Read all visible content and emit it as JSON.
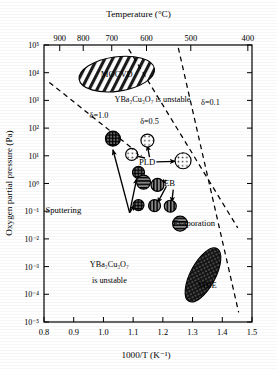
{
  "chart_data": {
    "type": "scatter",
    "title": "",
    "xlabel": "1000/T (K⁻¹)",
    "ylabel": "Oxygen partial pressure (Pa)",
    "top_axis_label": "Temperature  (°C)",
    "xlim": [
      0.8,
      1.5
    ],
    "ylim_exp": [
      -5,
      5
    ],
    "yscale": "log",
    "grid": false,
    "legend_position": "none",
    "x_ticks": [
      "0.8",
      "0.9",
      "1.0",
      "1.1",
      "1.2",
      "1.3",
      "1.4",
      "1.5"
    ],
    "x_tick_values": [
      0.8,
      0.9,
      1.0,
      1.1,
      1.2,
      1.3,
      1.4,
      1.5
    ],
    "y_ticks": [
      "10⁵",
      "10⁴",
      "10³",
      "10²",
      "10¹",
      "10⁰",
      "10⁻¹",
      "10⁻²",
      "10⁻³",
      "10⁻⁴",
      "10⁻⁵"
    ],
    "y_tick_exponents": [
      5,
      4,
      3,
      2,
      1,
      0,
      -1,
      -2,
      -3,
      -4,
      -5
    ],
    "top_ticks": [
      "900",
      "800",
      "700",
      "600",
      "500",
      "400"
    ],
    "top_tick_celsius": [
      900,
      800,
      700,
      600,
      500,
      400
    ],
    "top_tick_x": [
      0.853,
      0.932,
      1.028,
      1.145,
      1.294,
      1.486
    ],
    "annotations": [
      {
        "name": "delta-1-0",
        "text": "δ=1.0",
        "x": 0.985,
        "y_exp": 2.35
      },
      {
        "name": "delta-0-5",
        "text": "δ=0.5",
        "x": 1.155,
        "y_exp": 2.15
      },
      {
        "name": "delta-0-1",
        "text": "δ=0.1",
        "x": 1.36,
        "y_exp": 2.85
      },
      {
        "name": "ybco-unstable-upper",
        "text": "YBa₂Cu₃O₇ is unstable",
        "x": 1.165,
        "y_exp": 2.95
      },
      {
        "name": "ybco-unstable-lower-line1",
        "text": "YBa₂Cu₃O₇",
        "x": 1.02,
        "y_exp": -3.0
      },
      {
        "name": "ybco-unstable-lower-line2",
        "text": "is unstable",
        "x": 1.02,
        "y_exp": -3.6
      }
    ],
    "regions": [
      {
        "name": "mocvd",
        "label": "MOCVD",
        "x": 1.045,
        "y_exp": 3.95,
        "rx_x": 0.128,
        "ry_exp": 0.62,
        "rotation": -8,
        "hatch": "diagonal-forward"
      },
      {
        "name": "mbe",
        "label": "MBE",
        "x": 1.335,
        "y_exp": -3.3,
        "rx_x": 0.042,
        "ry_exp": 1.08,
        "rotation": 28,
        "hatch": "crosshatch-dense"
      }
    ],
    "method_labels": [
      {
        "name": "sputtering",
        "text": "Sputtering",
        "x": 0.865,
        "y_exp": -0.95
      },
      {
        "name": "pld",
        "text": "PLD",
        "x": 1.147,
        "y_exp": 0.78
      },
      {
        "name": "eb",
        "text": "EB",
        "x": 1.222,
        "y_exp": 0.02
      },
      {
        "name": "evaporation",
        "text": "Evaporation",
        "x": 1.305,
        "y_exp": -1.42
      },
      {
        "name": "mocvd",
        "text": "MOCVD",
        "x": 1.045,
        "y_exp": 3.95
      },
      {
        "name": "mbe",
        "text": "MBE",
        "x": 1.35,
        "y_exp": -3.65
      }
    ],
    "markers": [
      {
        "name": "marker-sputtering-a",
        "x": 1.032,
        "y_exp": 1.62,
        "fill": "grid",
        "r": 7.5
      },
      {
        "name": "marker-sputtering-b",
        "x": 1.095,
        "y_exp": 1.05,
        "fill": "dots",
        "r": 6.0
      },
      {
        "name": "marker-sputtering-c",
        "x": 1.118,
        "y_exp": 0.4,
        "fill": "grid",
        "r": 6.0
      },
      {
        "name": "marker-sputtering-d",
        "x": 1.135,
        "y_exp": 0.05,
        "fill": "horizontal",
        "r": 7.0
      },
      {
        "name": "marker-sputtering-e",
        "x": 1.182,
        "y_exp": -0.05,
        "fill": "vertical",
        "r": 6.5
      },
      {
        "name": "marker-sputtering-f",
        "x": 1.118,
        "y_exp": -0.78,
        "fill": "grid",
        "r": 5.5
      },
      {
        "name": "marker-sputtering-g",
        "x": 1.172,
        "y_exp": -0.8,
        "fill": "vertical",
        "r": 6.0
      },
      {
        "name": "marker-sputtering-h",
        "x": 1.225,
        "y_exp": -0.82,
        "fill": "vertical",
        "r": 6.0
      },
      {
        "name": "marker-pld-a",
        "x": 1.148,
        "y_exp": 1.55,
        "fill": "dots",
        "r": 6.5
      },
      {
        "name": "marker-pld-b",
        "x": 1.268,
        "y_exp": 0.82,
        "fill": "dots",
        "r": 8.0
      },
      {
        "name": "marker-evaporation",
        "x": 1.258,
        "y_exp": -1.45,
        "fill": "horizontal",
        "r": 7.5
      }
    ],
    "arrows": [
      {
        "name": "arrow-sputtering-trunk",
        "x1": 1.088,
        "y1_exp": -1.05,
        "x2": 1.032,
        "y2_exp": 1.22
      },
      {
        "name": "arrow-sputtering-to-c",
        "x1": 1.088,
        "y1_exp": -1.05,
        "x2": 1.112,
        "y2_exp": 0.18
      },
      {
        "name": "arrow-sputtering-to-f",
        "x1": 1.088,
        "y1_exp": -1.05,
        "x2": 1.105,
        "y2_exp": -0.78
      },
      {
        "name": "arrow-pld-to-b",
        "x1": 1.178,
        "y1_exp": 0.78,
        "x2": 1.242,
        "y2_exp": 0.8
      },
      {
        "name": "arrow-pld-to-a",
        "x1": 1.155,
        "y1_exp": 0.95,
        "x2": 1.148,
        "y2_exp": 1.38
      },
      {
        "name": "arrow-pld-to-sput-b",
        "x1": 1.14,
        "y1_exp": 0.92,
        "x2": 1.1,
        "y2_exp": 1.02
      },
      {
        "name": "arrow-eb-to-e",
        "x1": 1.212,
        "y1_exp": 0.12,
        "x2": 1.192,
        "y2_exp": 0.0
      },
      {
        "name": "arrow-eb-to-g",
        "x1": 1.212,
        "y1_exp": -0.1,
        "x2": 1.182,
        "y2_exp": -0.7
      },
      {
        "name": "arrow-eb-to-h",
        "x1": 1.235,
        "y1_exp": -0.22,
        "x2": 1.23,
        "y2_exp": -0.68
      }
    ],
    "boundary_lines": [
      {
        "name": "delta-1-0-line",
        "x1": 0.818,
        "y1_exp": 3.65,
        "x2": 1.128,
        "y2_exp": 1.0,
        "style": "dashed"
      },
      {
        "name": "delta-0-5-line",
        "x1": 1.085,
        "y1_exp": 4.85,
        "x2": 1.452,
        "y2_exp": -1.6,
        "style": "dashed"
      },
      {
        "name": "delta-0-1-line",
        "x1": 1.252,
        "y1_exp": 4.9,
        "x2": 1.455,
        "y2_exp": -4.65,
        "style": "dashed"
      }
    ]
  },
  "figure": {
    "top_axis_label": "Temperature  (°C)",
    "y_axis_label": "Oxygen partial pressure (Pa)",
    "x_axis_label": "1000/T (K⁻¹)",
    "frame_color": "#000000",
    "background": "#ffffff"
  }
}
